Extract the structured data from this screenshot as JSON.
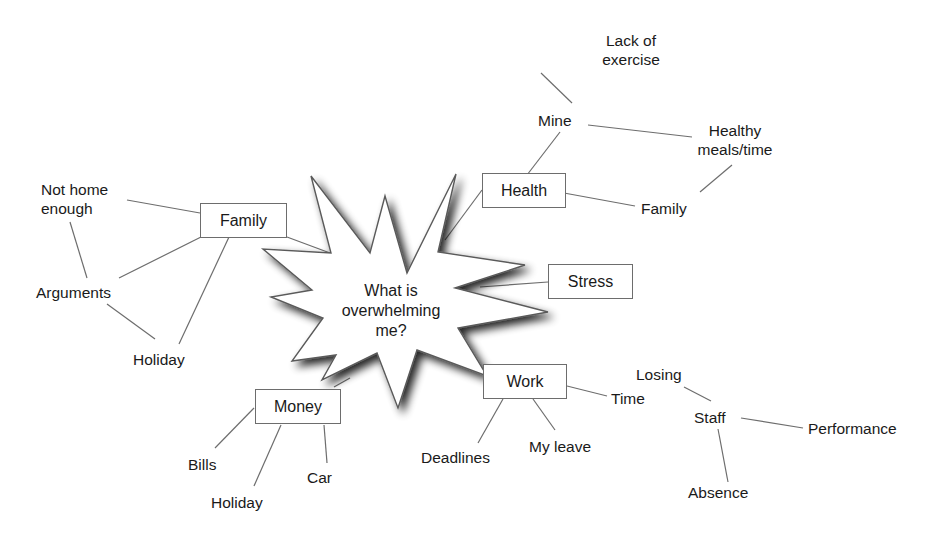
{
  "diagram": {
    "type": "mind-map",
    "center": {
      "label_lines": [
        "What is",
        "overwhelming",
        "me?"
      ]
    },
    "colors": {
      "line": "#6d6d6d",
      "text": "#1a1a1a",
      "background": "#ffffff"
    },
    "branches": {
      "family": {
        "label": "Family",
        "children": {
          "not_home_enough": [
            "Not home",
            "enough"
          ],
          "arguments": "Arguments",
          "holiday": "Holiday"
        }
      },
      "health": {
        "label": "Health",
        "children": {
          "mine": "Mine",
          "lack_of_exercise": [
            "Lack of",
            "exercise"
          ],
          "healthy_meals": [
            "Healthy",
            "meals/time"
          ],
          "family": "Family"
        }
      },
      "stress": {
        "label": "Stress"
      },
      "work": {
        "label": "Work",
        "children": {
          "time": "Time",
          "deadlines": "Deadlines",
          "my_leave": "My leave",
          "losing": "Losing",
          "staff": "Staff",
          "performance": "Performance",
          "absence": "Absence"
        }
      },
      "money": {
        "label": "Money",
        "children": {
          "bills": "Bills",
          "holiday": "Holiday",
          "car": "Car"
        }
      }
    }
  }
}
